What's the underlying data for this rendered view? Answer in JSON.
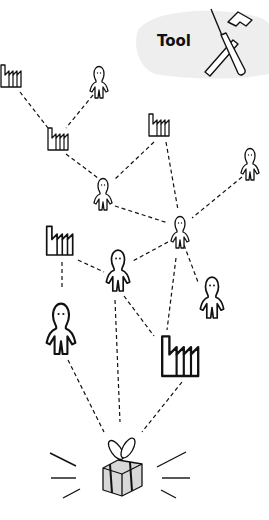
{
  "title_label": "Tool",
  "colors": {
    "stroke": "#111111",
    "banner": "#eeeeee",
    "gift_fill": "#d8d8d8"
  },
  "nodes": [
    {
      "id": "factory-1",
      "type": "factory",
      "x": 12,
      "y": 77
    },
    {
      "id": "person-1",
      "type": "person",
      "x": 99,
      "y": 78
    },
    {
      "id": "factory-2",
      "type": "factory",
      "x": 59,
      "y": 140
    },
    {
      "id": "factory-3",
      "type": "factory",
      "x": 160,
      "y": 126
    },
    {
      "id": "person-2",
      "type": "person",
      "x": 103,
      "y": 190
    },
    {
      "id": "person-3",
      "type": "person",
      "x": 250,
      "y": 160
    },
    {
      "id": "person-4",
      "type": "person",
      "x": 180,
      "y": 228
    },
    {
      "id": "factory-4",
      "type": "factory",
      "x": 62,
      "y": 240
    },
    {
      "id": "person-5",
      "type": "person",
      "x": 118,
      "y": 265
    },
    {
      "id": "person-6",
      "type": "person",
      "x": 212,
      "y": 292
    },
    {
      "id": "person-7",
      "type": "person",
      "x": 61,
      "y": 325
    },
    {
      "id": "factory-5",
      "type": "factory",
      "x": 182,
      "y": 352
    },
    {
      "id": "gift",
      "type": "gift",
      "x": 122,
      "y": 470
    }
  ]
}
